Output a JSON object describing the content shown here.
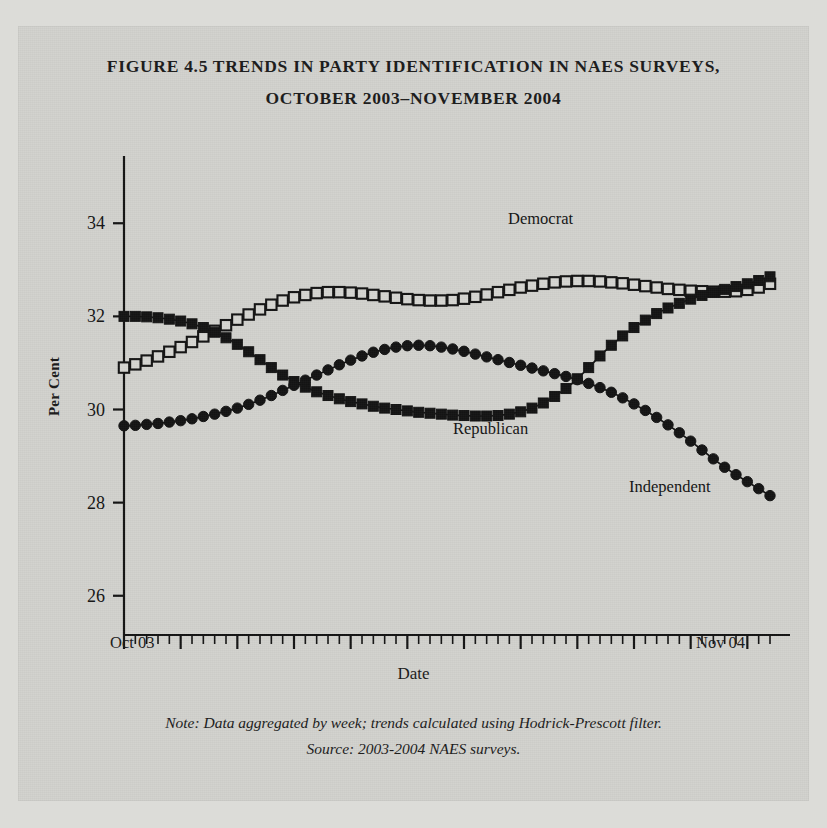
{
  "figure": {
    "title_line_1": "FIGURE 4.5 TRENDS IN PARTY IDENTIFICATION IN NAES SURVEYS,",
    "title_line_2": "OCTOBER 2003–NOVEMBER 2004",
    "note": "Note: Data aggregated by week; trends calculated using Hodrick-Prescott filter.",
    "source": "Source: 2003-2004 NAES surveys.",
    "x_start_label": "Oct 03",
    "x_end_label": "Nov 04"
  },
  "colors": {
    "ink": "#141414",
    "paper": "#d2d2ce",
    "margin": "#dcdcd8"
  },
  "chart_data": {
    "type": "line",
    "title": "FIGURE 4.5 TRENDS IN PARTY IDENTIFICATION IN NAES SURVEYS, OCTOBER 2003–NOVEMBER 2004",
    "xlabel": "Date",
    "ylabel": "Per Cent",
    "ylim": [
      25.2,
      34.8
    ],
    "yticks": [
      26,
      28,
      30,
      32,
      34
    ],
    "ytick_labels": [
      "26",
      "28",
      "30",
      "32",
      "34"
    ],
    "xlim": [
      0,
      57
    ],
    "xtick_labels": [
      "Oct 03",
      "Nov 04"
    ],
    "grid": false,
    "legend": "inline-annotations",
    "x_minor_tick_count": 57,
    "x_major_tick_every": 5,
    "x": [
      0,
      1,
      2,
      3,
      4,
      5,
      6,
      7,
      8,
      9,
      10,
      11,
      12,
      13,
      14,
      15,
      16,
      17,
      18,
      19,
      20,
      21,
      22,
      23,
      24,
      25,
      26,
      27,
      28,
      29,
      30,
      31,
      32,
      33,
      34,
      35,
      36,
      37,
      38,
      39,
      40,
      41,
      42,
      43,
      44,
      45,
      46,
      47,
      48,
      49,
      50,
      51,
      52,
      53,
      54,
      55,
      56,
      57
    ],
    "series": [
      {
        "name": "Democrat",
        "marker": "open-square",
        "values": [
          30.9,
          30.97,
          31.05,
          31.14,
          31.24,
          31.34,
          31.45,
          31.57,
          31.69,
          31.81,
          31.93,
          32.04,
          32.15,
          32.25,
          32.34,
          32.41,
          32.46,
          32.5,
          32.52,
          32.52,
          32.51,
          32.49,
          32.46,
          32.43,
          32.4,
          32.37,
          32.35,
          32.34,
          32.34,
          32.35,
          32.38,
          32.42,
          32.47,
          32.52,
          32.57,
          32.62,
          32.66,
          32.7,
          32.73,
          32.75,
          32.76,
          32.76,
          32.75,
          32.73,
          32.71,
          32.68,
          32.65,
          32.62,
          32.59,
          32.57,
          32.55,
          32.54,
          32.53,
          32.53,
          32.54,
          32.57,
          32.62,
          32.7
        ]
      },
      {
        "name": "Republican",
        "marker": "filled-square",
        "values": [
          32.0,
          32.0,
          31.99,
          31.97,
          31.94,
          31.9,
          31.84,
          31.76,
          31.66,
          31.54,
          31.4,
          31.24,
          31.07,
          30.9,
          30.74,
          30.6,
          30.48,
          30.38,
          30.3,
          30.23,
          30.17,
          30.12,
          30.07,
          30.03,
          30.0,
          29.97,
          29.94,
          29.92,
          29.9,
          29.88,
          29.87,
          29.86,
          29.86,
          29.87,
          29.9,
          29.95,
          30.03,
          30.14,
          30.28,
          30.45,
          30.66,
          30.9,
          31.15,
          31.38,
          31.58,
          31.76,
          31.92,
          32.06,
          32.18,
          32.28,
          32.37,
          32.45,
          32.52,
          32.58,
          32.64,
          32.7,
          32.77,
          32.85
        ]
      },
      {
        "name": "Independent",
        "marker": "filled-circle",
        "values": [
          29.65,
          29.66,
          29.68,
          29.7,
          29.73,
          29.76,
          29.8,
          29.85,
          29.9,
          29.96,
          30.03,
          30.11,
          30.2,
          30.3,
          30.41,
          30.52,
          30.63,
          30.74,
          30.85,
          30.96,
          31.06,
          31.15,
          31.23,
          31.29,
          31.34,
          31.37,
          31.38,
          31.37,
          31.34,
          31.3,
          31.25,
          31.19,
          31.13,
          31.07,
          31.01,
          30.95,
          30.89,
          30.83,
          30.77,
          30.71,
          30.64,
          30.56,
          30.47,
          30.37,
          30.25,
          30.12,
          29.98,
          29.83,
          29.67,
          29.5,
          29.32,
          29.13,
          28.94,
          28.76,
          28.6,
          28.45,
          28.3,
          28.15
        ]
      }
    ]
  }
}
